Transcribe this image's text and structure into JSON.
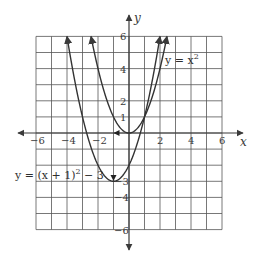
{
  "chart_data": {
    "type": "line",
    "title": "",
    "xlabel": "x",
    "ylabel": "y",
    "xlim": [
      -6,
      6
    ],
    "ylim": [
      -6,
      6
    ],
    "grid": true,
    "grid_step": 1,
    "x_tick_labels": [
      "-6",
      "-4",
      "-2",
      "2",
      "4",
      "6"
    ],
    "y_tick_labels": [
      "6",
      "4",
      "2",
      "1",
      "-3",
      "-4",
      "-6"
    ],
    "series": [
      {
        "name": "y = x^2",
        "label_text": "y = x",
        "label_exponent": "2",
        "vertex": [
          0,
          0
        ],
        "x": [
          -2.45,
          -2,
          -1.5,
          -1,
          -0.5,
          0,
          0.5,
          1,
          1.5,
          2,
          2.45
        ],
        "y": [
          6,
          4,
          2.25,
          1,
          0.25,
          0,
          0.25,
          1,
          2.25,
          4,
          6
        ]
      },
      {
        "name": "y = (x + 1)^2 - 3",
        "label_text_a": "y = (x + 1)",
        "label_exponent": "2",
        "label_text_b": " − 3",
        "vertex": [
          -1,
          -3
        ],
        "x": [
          -4,
          -3.5,
          -3,
          -2.5,
          -2,
          -1.5,
          -1,
          -0.5,
          0,
          0.5,
          1,
          1.5,
          2
        ],
        "y": [
          6,
          3.25,
          1,
          -0.75,
          -2,
          -2.75,
          -3,
          -2.75,
          -2,
          -0.75,
          1,
          3.25,
          6
        ]
      }
    ],
    "annotations": [
      {
        "type": "arrow-marker",
        "at": [
          -1,
          0
        ],
        "direction": "left",
        "meaning": "shift left 1"
      },
      {
        "type": "arrow-marker",
        "at": [
          -1,
          -3
        ],
        "direction": "down",
        "meaning": "shift down 3"
      }
    ]
  }
}
